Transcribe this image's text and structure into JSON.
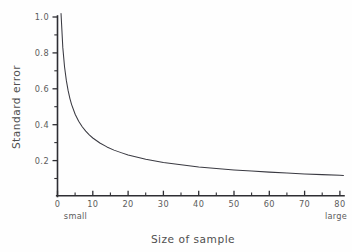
{
  "chart_data": {
    "type": "line",
    "title": "",
    "xlabel": "Size of sample",
    "ylabel": "Standard error",
    "xlim": [
      0,
      82
    ],
    "ylim": [
      0,
      1.08
    ],
    "grid": false,
    "legend": "none",
    "x_ticks": [
      0,
      10,
      20,
      30,
      40,
      50,
      60,
      70,
      80
    ],
    "x_tick_labels": [
      "0",
      "10",
      "20",
      "30",
      "40",
      "50",
      "60",
      "70",
      "80"
    ],
    "x_minor_ticks": [
      5,
      15,
      25,
      35,
      45,
      55,
      65,
      75
    ],
    "y_ticks": [
      0.2,
      0.4,
      0.6,
      0.8,
      1.0
    ],
    "y_tick_labels": [
      "0.2",
      "0.4",
      "0.6",
      "0.8",
      "1.0"
    ],
    "y_minor_ticks": [
      0.1,
      0.3,
      0.5,
      0.7,
      0.9
    ],
    "annotations": [
      {
        "text": "small",
        "x": 5,
        "position": "below-axis"
      },
      {
        "text": "large",
        "x": 79,
        "position": "below-axis"
      }
    ],
    "series": [
      {
        "name": "standard error",
        "relation": "1/sqrt(n)",
        "x": [
          1,
          1.5,
          2,
          2.5,
          3,
          3.5,
          4,
          5,
          6,
          7,
          8,
          9,
          10,
          12,
          14,
          16,
          18,
          20,
          25,
          30,
          35,
          40,
          45,
          50,
          55,
          60,
          65,
          70,
          75,
          80,
          81
        ],
        "y": [
          1.02,
          0.83,
          0.72,
          0.645,
          0.589,
          0.545,
          0.51,
          0.456,
          0.417,
          0.386,
          0.361,
          0.34,
          0.323,
          0.295,
          0.273,
          0.255,
          0.241,
          0.228,
          0.204,
          0.186,
          0.173,
          0.161,
          0.152,
          0.144,
          0.138,
          0.132,
          0.127,
          0.122,
          0.118,
          0.114,
          0.113
        ]
      }
    ]
  },
  "axis_titles": {
    "y": "Standard error",
    "x": "Size of sample"
  },
  "colors": {
    "background": "#fefefe",
    "axis": "#2e2e33",
    "curve": "#3a3a42",
    "text": "#5c5c5c"
  }
}
